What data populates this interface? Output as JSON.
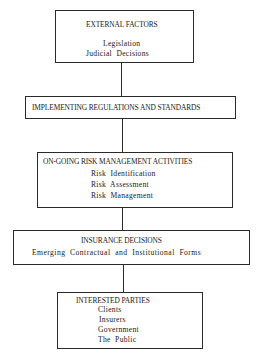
{
  "diagram": {
    "type": "flowchart",
    "nodes": [
      {
        "id": "external-factors",
        "title": "EXTERNAL FACTORS",
        "items": [
          "Legislation",
          "Judicial  Decisions"
        ]
      },
      {
        "id": "implementing-regulations",
        "title": "IMPLEMENTING REGULATIONS AND STANDARDS",
        "items": []
      },
      {
        "id": "risk-management-activities",
        "title": "ON-GOING RISK MANAGEMENT ACTIVITIES",
        "items": [
          "Risk  Identification",
          "Risk  Assessment",
          "Risk  Management"
        ]
      },
      {
        "id": "insurance-decisions",
        "title": "INSURANCE DECISIONS",
        "items": [
          "Emerging  Contractual  and  Institutional  Forms"
        ]
      },
      {
        "id": "interested-parties",
        "title": "INTERESTED PARTIES",
        "items": [
          "Clients",
          "Insurers",
          "Government",
          "The  Public"
        ]
      }
    ],
    "edges": [
      {
        "from": "external-factors",
        "to": "implementing-regulations"
      },
      {
        "from": "implementing-regulations",
        "to": "risk-management-activities"
      },
      {
        "from": "risk-management-activities",
        "to": "insurance-decisions"
      },
      {
        "from": "insurance-decisions",
        "to": "interested-parties"
      }
    ]
  }
}
